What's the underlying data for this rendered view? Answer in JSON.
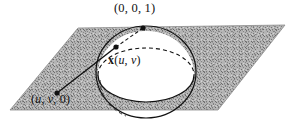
{
  "figure": {
    "caption_type": "stereographic-projection-diagram",
    "labels": {
      "north_pole": "(0, 0, 1)",
      "plane_point_open": "(",
      "plane_point_u": "u",
      "plane_point_sep1": ", ",
      "plane_point_v": "v",
      "plane_point_sep2": ", 0)",
      "sphere_point_x": "x",
      "sphere_point_open": "(",
      "sphere_point_u": "u",
      "sphere_point_sep": ", ",
      "sphere_point_v": "v",
      "sphere_point_close": ")"
    },
    "colors": {
      "ink": "#111111",
      "plane_fill": "#a9a9a9",
      "sphere_fill": "#ffffff",
      "background": "#ffffff"
    },
    "geometry": {
      "plane_corners": "78,28 285,25 218,110 10,110",
      "sphere_center_x": 146,
      "sphere_center_y": 72,
      "sphere_radius_x": 50,
      "sphere_radius_y": 46,
      "north_pole_point": "143,28",
      "sphere_surface_point": "116,47",
      "plane_point": "57,93"
    }
  }
}
